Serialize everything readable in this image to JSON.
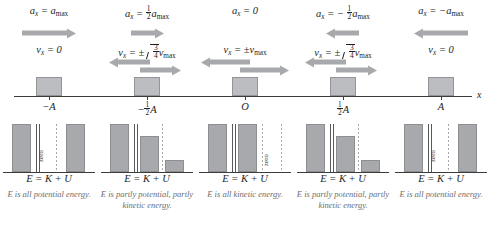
{
  "diagram": {
    "axis_label": "x",
    "energy_equation": "E = K + U",
    "zero_label": "zero",
    "columns": [
      {
        "position_label": "-A",
        "accel_text": "a_x = a_max",
        "accel_arrow": "right-long",
        "vel_text": "v_x = 0",
        "vel_arrow": "none",
        "caption": "E is all potential energy.",
        "bars": {
          "E": 100,
          "K": 0,
          "U": 100
        },
        "zero_on": "K"
      },
      {
        "position_label": "-1/2 A",
        "accel_text": "a_x = 1/2 a_max",
        "accel_arrow": "right-short",
        "vel_text": "v_x = ± sqrt(3/4) v_max",
        "vel_arrow": "both",
        "caption": "E is partly potential, partly kinetic energy.",
        "bars": {
          "E": 100,
          "K": 75,
          "U": 25
        },
        "zero_on": "none"
      },
      {
        "position_label": "O",
        "accel_text": "a_x = 0",
        "accel_arrow": "none",
        "vel_text": "v_x = ±v_max",
        "vel_arrow": "both",
        "caption": "E is all kinetic energy.",
        "bars": {
          "E": 100,
          "K": 100,
          "U": 0
        },
        "zero_on": "U"
      },
      {
        "position_label": "1/2 A",
        "accel_text": "a_x = -1/2 a_max",
        "accel_arrow": "left-short",
        "vel_text": "v_x = ± sqrt(3/4) v_max",
        "vel_arrow": "both",
        "caption": "E is partly potential, partly kinetic energy.",
        "bars": {
          "E": 100,
          "K": 75,
          "U": 25
        },
        "zero_on": "none"
      },
      {
        "position_label": "A",
        "accel_text": "a_x = -a_max",
        "accel_arrow": "left-long",
        "vel_text": "v_x = 0",
        "vel_arrow": "none",
        "caption": "E is all potential energy.",
        "bars": {
          "E": 100,
          "K": 0,
          "U": 100
        },
        "zero_on": "K"
      }
    ],
    "captions": [
      "E is all potential energy.",
      "E is partly potential, partly kinetic energy.",
      "E is all kinetic energy.",
      "E is partly potential, partly kinetic energy.",
      "E is all potential energy."
    ]
  }
}
